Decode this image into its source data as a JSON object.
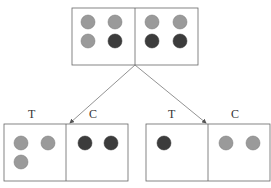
{
  "top_caption": "Population (pre-assignment)",
  "colors": {
    "light": "#9a9a9a",
    "dark": "#3c3c3c",
    "stroke": "#555555",
    "line": "#777777"
  },
  "top_box": {
    "left_cell": [
      "light",
      "light",
      "light",
      "dark"
    ],
    "right_cell": [
      "light",
      "light",
      "dark",
      "dark"
    ]
  },
  "bottom_left": {
    "treatment_label": "T",
    "control_label": "C",
    "treatment_units": [
      "light",
      "light",
      "light"
    ],
    "control_units": [
      "dark",
      "dark"
    ]
  },
  "bottom_right": {
    "treatment_label": "T",
    "control_label": "C",
    "treatment_units": [
      "dark"
    ],
    "control_units": [
      "light",
      "light"
    ]
  }
}
